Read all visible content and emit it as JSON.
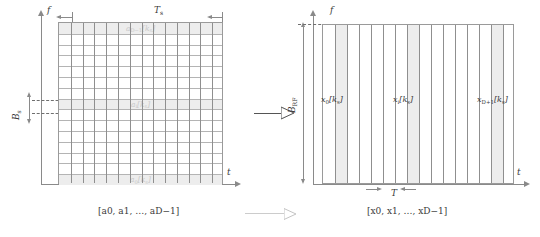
{
  "figure": {
    "type": "time-frequency-resource-grid-transform",
    "left_panel": {
      "name": "frequency-domain-subcarrier-grid",
      "axis_x_label": "t",
      "axis_y_label": "f",
      "width_label": "T",
      "width_label_sub": "s",
      "height_label": "B",
      "height_label_sub": "s",
      "grid_columns": 14,
      "grid_rows": 15,
      "highlighted_rows": [
        {
          "index": 0,
          "label": "a",
          "sub": "D−1",
          "bracket": "[k",
          "bracket_sub": "s",
          "bracket_close": "]"
        },
        {
          "index": 7,
          "label": "a",
          "sub": "i",
          "bracket": "[k",
          "bracket_sub": "s",
          "bracket_close": "]"
        },
        {
          "index": 14,
          "label": "a",
          "sub": "0",
          "bracket": "[k",
          "bracket_sub": "s",
          "bracket_close": "]"
        }
      ],
      "vector_label_prefix": "[a",
      "vector_label": "[a0, a1, …, aD−1]"
    },
    "right_panel": {
      "name": "time-domain-sample-grid",
      "axis_x_label": "t",
      "axis_y_label": "f",
      "height_label": "B",
      "height_label_sub": "RF",
      "sample_period_label": "T",
      "columns": 16,
      "highlighted_columns": [
        {
          "index": 1,
          "label": "x",
          "sub": "0",
          "bracket": "[k",
          "bracket_sub": "s",
          "bracket_close": "]"
        },
        {
          "index": 7,
          "label": "x",
          "sub": "i",
          "bracket": "[k",
          "bracket_sub": "s",
          "bracket_close": "]"
        },
        {
          "index": 14,
          "label": "x",
          "sub": "D+1",
          "bracket": "[k",
          "bracket_sub": "s",
          "bracket_close": "]"
        }
      ],
      "vector_label": "[x0, x1, …, xD−1]"
    },
    "transform_arrow": {
      "name": "transform-arrow",
      "direction": "right"
    },
    "vector_arrow": {
      "name": "vector-mapping-arrow",
      "direction": "right"
    },
    "colors": {
      "grid_line": "#8f8f8f",
      "minor_line": "#b4b4b4",
      "highlight": "#ededed",
      "axis": "#8a8a8a",
      "label_faint": "#c9c9c9",
      "text": "#3a3a3a"
    }
  }
}
